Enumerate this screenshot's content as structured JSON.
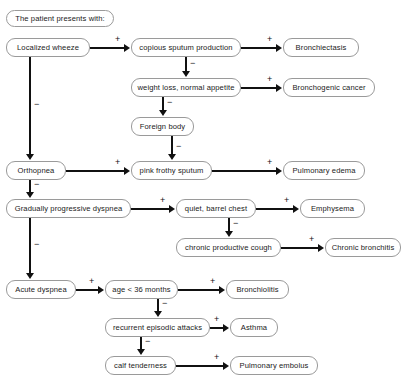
{
  "diagram": {
    "header": {
      "label": "The patient presents with:"
    },
    "signs": {
      "positive": "+",
      "negative": "−"
    },
    "nodes": [
      {
        "id": "header",
        "label": "The patient presents with:",
        "x": 6,
        "y": 10,
        "w": 108,
        "h": 17
      },
      {
        "id": "loc_wheeze",
        "label": "Localized wheeze",
        "x": 6,
        "y": 38,
        "w": 84,
        "h": 19
      },
      {
        "id": "copious",
        "label": "copious sputum production",
        "x": 131,
        "y": 38,
        "w": 110,
        "h": 19
      },
      {
        "id": "bronchiectasis",
        "label": "Bronchiectasis",
        "x": 283,
        "y": 38,
        "w": 76,
        "h": 19
      },
      {
        "id": "weightloss",
        "label": "weight loss, normal appetite",
        "x": 131,
        "y": 78,
        "w": 110,
        "h": 19
      },
      {
        "id": "bronchogenic",
        "label": "Bronchogenic cancer",
        "x": 283,
        "y": 78,
        "w": 92,
        "h": 19
      },
      {
        "id": "foreign",
        "label": "Foreign body",
        "x": 131,
        "y": 117,
        "w": 63,
        "h": 19
      },
      {
        "id": "orthopnea",
        "label": "Orthopnea",
        "x": 6,
        "y": 161,
        "w": 60,
        "h": 19
      },
      {
        "id": "pinkfrothy",
        "label": "pink frothy sputum",
        "x": 131,
        "y": 161,
        "w": 81,
        "h": 19
      },
      {
        "id": "pulm_edema",
        "label": "Pulmonary edema",
        "x": 283,
        "y": 161,
        "w": 82,
        "h": 19
      },
      {
        "id": "grad_dyspnea",
        "label": "Gradually progressive dyspnea",
        "x": 6,
        "y": 199,
        "w": 125,
        "h": 19
      },
      {
        "id": "quiet_barrel",
        "label": "quiet, barrel chest",
        "x": 176,
        "y": 199,
        "w": 80,
        "h": 19
      },
      {
        "id": "emphysema",
        "label": "Emphysema",
        "x": 300,
        "y": 199,
        "w": 65,
        "h": 19
      },
      {
        "id": "chronic_cough",
        "label": "chronic productive cough",
        "x": 176,
        "y": 238,
        "w": 105,
        "h": 19
      },
      {
        "id": "chronic_bronch",
        "label": "Chronic bronchitis",
        "x": 325,
        "y": 238,
        "w": 76,
        "h": 19
      },
      {
        "id": "acute_dyspnea",
        "label": "Acute dyspnea",
        "x": 6,
        "y": 280,
        "w": 70,
        "h": 19
      },
      {
        "id": "age36",
        "label": "age < 36 months",
        "x": 105,
        "y": 280,
        "w": 73,
        "h": 19
      },
      {
        "id": "bronchiolitis",
        "label": "Bronchiolitis",
        "x": 226,
        "y": 280,
        "w": 63,
        "h": 19
      },
      {
        "id": "recurrent",
        "label": "recurrent episodic attacks",
        "x": 105,
        "y": 318,
        "w": 105,
        "h": 19
      },
      {
        "id": "asthma",
        "label": "Asthma",
        "x": 230,
        "y": 318,
        "w": 48,
        "h": 19
      },
      {
        "id": "calf",
        "label": "calf tenderness",
        "x": 105,
        "y": 356,
        "w": 71,
        "h": 19
      },
      {
        "id": "pulm_embolus",
        "label": "Pulmonary embolus",
        "x": 230,
        "y": 356,
        "w": 88,
        "h": 19
      }
    ],
    "edges": [
      {
        "from": "loc_wheeze",
        "to": "copious",
        "sign": "+",
        "direction": "right"
      },
      {
        "from": "copious",
        "to": "bronchiectasis",
        "sign": "+",
        "direction": "right"
      },
      {
        "from": "copious",
        "to": "weightloss",
        "sign": "−",
        "direction": "down"
      },
      {
        "from": "weightloss",
        "to": "bronchogenic",
        "sign": "+",
        "direction": "right"
      },
      {
        "from": "weightloss",
        "to": "foreign",
        "sign": "−",
        "direction": "down"
      },
      {
        "from": "foreign",
        "to": "pinkfrothy",
        "sign": "−",
        "direction": "down"
      },
      {
        "from": "loc_wheeze",
        "to": "orthopnea",
        "sign": "−",
        "direction": "down"
      },
      {
        "from": "orthopnea",
        "to": "pinkfrothy",
        "sign": "+",
        "direction": "right"
      },
      {
        "from": "pinkfrothy",
        "to": "pulm_edema",
        "sign": "+",
        "direction": "right"
      },
      {
        "from": "orthopnea",
        "to": "grad_dyspnea",
        "sign": "−",
        "direction": "down"
      },
      {
        "from": "grad_dyspnea",
        "to": "quiet_barrel",
        "sign": "+",
        "direction": "right"
      },
      {
        "from": "quiet_barrel",
        "to": "emphysema",
        "sign": "+",
        "direction": "right"
      },
      {
        "from": "quiet_barrel",
        "to": "chronic_cough",
        "sign": "−",
        "direction": "down"
      },
      {
        "from": "chronic_cough",
        "to": "chronic_bronch",
        "sign": "+",
        "direction": "right"
      },
      {
        "from": "grad_dyspnea",
        "to": "acute_dyspnea",
        "sign": "−",
        "direction": "down"
      },
      {
        "from": "acute_dyspnea",
        "to": "age36",
        "sign": "+",
        "direction": "right"
      },
      {
        "from": "age36",
        "to": "bronchiolitis",
        "sign": "+",
        "direction": "right"
      },
      {
        "from": "age36",
        "to": "recurrent",
        "sign": "−",
        "direction": "down"
      },
      {
        "from": "recurrent",
        "to": "asthma",
        "sign": "+",
        "direction": "right"
      },
      {
        "from": "recurrent",
        "to": "calf",
        "sign": "−",
        "direction": "down"
      },
      {
        "from": "calf",
        "to": "pulm_embolus",
        "sign": "+",
        "direction": "right"
      }
    ],
    "colors": {
      "background": "#ffffff",
      "node_fill": "#ffffff",
      "node_border": "#9a9a9a",
      "edge": "#111111",
      "text": "#1a1a1a"
    }
  }
}
